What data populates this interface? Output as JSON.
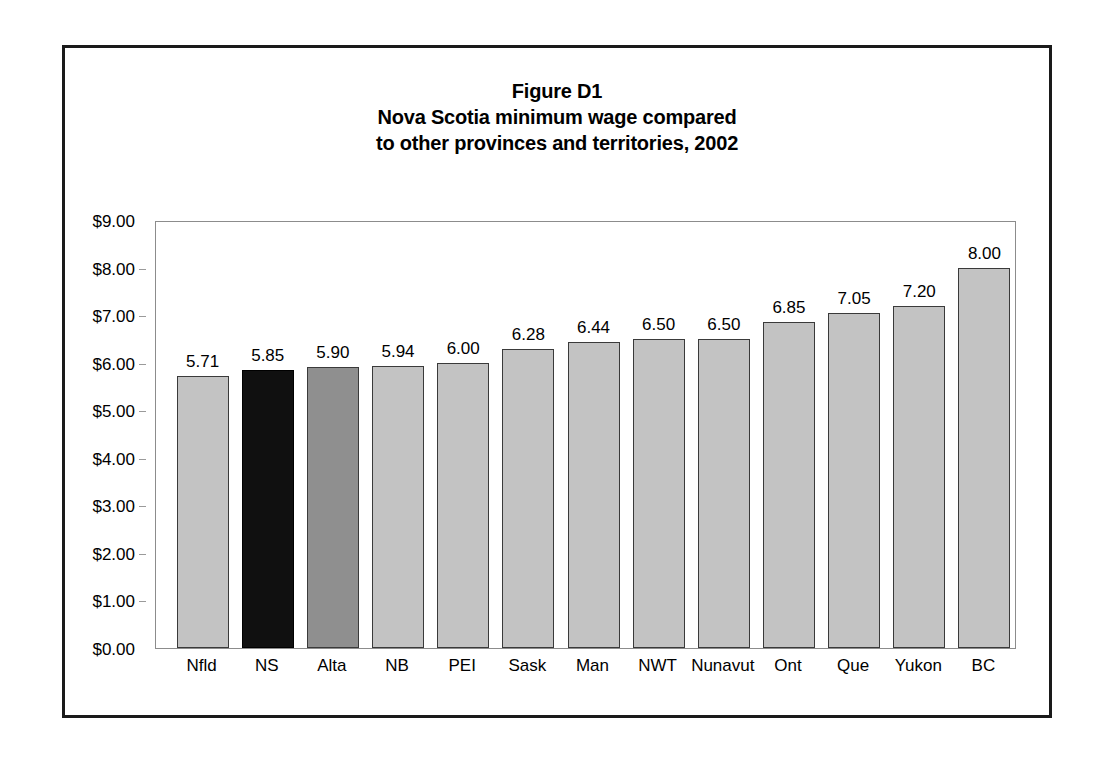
{
  "figure": {
    "title_lines": [
      "Figure D1",
      "Nova Scotia minimum wage compared",
      "to other provinces and territories, 2002"
    ]
  },
  "chart_data": {
    "type": "bar",
    "title": "Figure D1 Nova Scotia minimum wage compared to other provinces and territories, 2002",
    "xlabel": "",
    "ylabel": "",
    "ylim": [
      0,
      9
    ],
    "ytick_step": 1,
    "grid": false,
    "legend": "none",
    "value_label_format": "0.00",
    "ytick_labels": [
      "$0.00",
      "$1.00",
      "$2.00",
      "$3.00",
      "$4.00",
      "$5.00",
      "$6.00",
      "$7.00",
      "$8.00",
      "$9.00"
    ],
    "ytick_values": [
      0,
      1,
      2,
      3,
      4,
      5,
      6,
      7,
      8,
      9
    ],
    "categories": [
      "Nfld",
      "NS",
      "Alta",
      "NB",
      "PEI",
      "Sask",
      "Man",
      "NWT",
      "Nunavut",
      "Ont",
      "Que",
      "Yukon",
      "BC"
    ],
    "values": [
      5.71,
      5.85,
      5.9,
      5.94,
      6.0,
      6.28,
      6.44,
      6.5,
      6.5,
      6.85,
      7.05,
      7.2,
      8.0
    ],
    "value_labels": [
      "5.71",
      "5.85",
      "5.90",
      "5.94",
      "6.00",
      "6.28",
      "6.44",
      "6.50",
      "6.50",
      "6.85",
      "7.05",
      "7.20",
      "8.00"
    ],
    "bar_styles": [
      "light",
      "black",
      "dark",
      "light",
      "light",
      "light",
      "light",
      "light",
      "light",
      "light",
      "light",
      "light",
      "light"
    ],
    "colors": {
      "light": "#c3c3c3",
      "dark": "#8f8f8f",
      "black": "#101010",
      "bar_border": "#3a3a3a",
      "axis": "#8c8c8c",
      "frame": "#1a1a1a",
      "text": "#000000",
      "background": "#ffffff"
    }
  }
}
